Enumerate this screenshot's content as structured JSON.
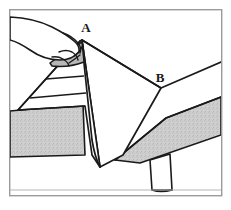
{
  "figure": {
    "kind": "line-art-instructional-diagram",
    "caption": "",
    "background_color": "#ffffff",
    "ink_color": "#1a1a1a",
    "frame": {
      "name": "figure-border",
      "color": "#9a9a9a",
      "fill": "#ffffff",
      "stroke_width": 1.4,
      "x": 9,
      "y": 9,
      "width": 213,
      "height": 187
    },
    "labels": [
      {
        "id": "label-a",
        "text": "A",
        "x": 86,
        "y": 32,
        "describes": "sheet corner held by the hand"
      },
      {
        "id": "label-b",
        "text": "B",
        "x": 160,
        "y": 82,
        "describes": "fold vertex at far side of the sheet"
      }
    ],
    "shading": {
      "band_fill": "#c8c8c8",
      "band_fill_light": "#d2d2d2",
      "fold_shadow_fill": "#b4b4b4",
      "texture_opacity": 0.55
    },
    "parts": [
      {
        "name": "hand",
        "description": "hand entering from left edge, fingers pinching corner A"
      },
      {
        "name": "sheet-triangular-fold",
        "description": "draped triangular flap hanging from A with three horizontal crease bands"
      },
      {
        "name": "sheet-main-panel",
        "description": "large white sheet panel spanning from A down to the bottom point and right to B"
      },
      {
        "name": "mattress-side-band-left",
        "description": "gray textured mattress side band on the left"
      },
      {
        "name": "mattress-side-band-right",
        "description": "gray textured mattress side band running to the right edge"
      },
      {
        "name": "bed-leg",
        "description": "tapered bed leg beneath the right band"
      }
    ]
  }
}
